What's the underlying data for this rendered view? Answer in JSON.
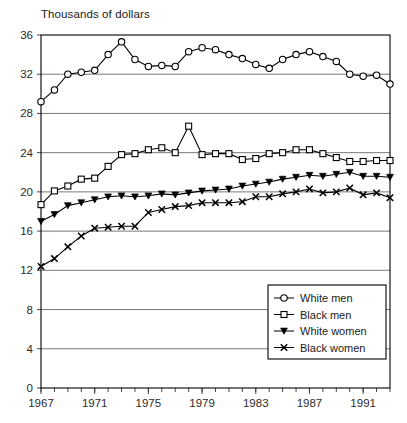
{
  "chart_data": {
    "type": "line",
    "title": "",
    "ylabel": "Thousands of dollars",
    "xlabel": "",
    "ylim": [
      0,
      36
    ],
    "xlim": [
      1967,
      1993
    ],
    "yticks": [
      0,
      4,
      8,
      12,
      16,
      20,
      24,
      28,
      32,
      36
    ],
    "xticks": [
      1967,
      1971,
      1975,
      1979,
      1983,
      1987,
      1991
    ],
    "xtick_minor_step": 1,
    "grid": "horizontal",
    "legend_position": "bottom-right",
    "x": [
      1967,
      1968,
      1969,
      1970,
      1971,
      1972,
      1973,
      1974,
      1975,
      1976,
      1977,
      1978,
      1979,
      1980,
      1981,
      1982,
      1983,
      1984,
      1985,
      1986,
      1987,
      1988,
      1989,
      1990,
      1991,
      1992,
      1993
    ],
    "series": [
      {
        "name": "White men",
        "marker": "open-circle",
        "values": [
          29.2,
          30.4,
          32.0,
          32.2,
          32.4,
          34.0,
          35.3,
          33.5,
          32.8,
          32.9,
          32.8,
          34.3,
          34.7,
          34.5,
          34.0,
          33.6,
          33.0,
          32.6,
          33.5,
          34.0,
          34.3,
          33.8,
          33.3,
          32.0,
          31.8,
          31.9,
          31.0
        ]
      },
      {
        "name": "Black men",
        "marker": "open-square",
        "values": [
          18.7,
          20.1,
          20.6,
          21.3,
          21.4,
          22.6,
          23.8,
          23.9,
          24.3,
          24.5,
          24.0,
          26.7,
          23.8,
          23.9,
          23.9,
          23.3,
          23.4,
          23.9,
          24.0,
          24.3,
          24.3,
          23.9,
          23.5,
          23.1,
          23.1,
          23.2,
          23.2
        ]
      },
      {
        "name": "White women",
        "marker": "filled-triangle-down",
        "values": [
          17.0,
          17.7,
          18.6,
          18.9,
          19.2,
          19.5,
          19.6,
          19.5,
          19.6,
          19.8,
          19.7,
          19.9,
          20.1,
          20.2,
          20.3,
          20.6,
          20.8,
          21.0,
          21.3,
          21.5,
          21.7,
          21.6,
          21.8,
          22.0,
          21.6,
          21.6,
          21.5
        ]
      },
      {
        "name": "Black women",
        "marker": "x",
        "values": [
          12.4,
          13.2,
          14.4,
          15.5,
          16.3,
          16.4,
          16.5,
          16.5,
          17.9,
          18.2,
          18.5,
          18.6,
          18.9,
          18.9,
          18.9,
          19.0,
          19.5,
          19.5,
          19.8,
          20.0,
          20.3,
          19.9,
          20.0,
          20.4,
          19.7,
          19.9,
          19.4
        ]
      }
    ]
  },
  "legend": {
    "items": [
      {
        "label": "White men"
      },
      {
        "label": "Black men"
      },
      {
        "label": "White women"
      },
      {
        "label": "Black women"
      }
    ]
  }
}
